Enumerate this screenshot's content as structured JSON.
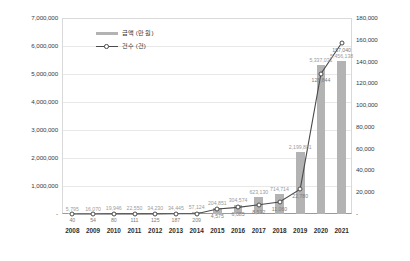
{
  "chart_data": {
    "type": "bar",
    "title": "",
    "subtitle": "",
    "xlabel": "",
    "ylabel": "",
    "categories": [
      "2008",
      "2009",
      "2010",
      "2011",
      "2012",
      "2013",
      "2014",
      "2015",
      "2016",
      "2017",
      "2018",
      "2019",
      "2020",
      "2021"
    ],
    "grid": true,
    "legend_position": "top-left",
    "axes": {
      "left": {
        "label": "금액 (만 원)",
        "ylim": [
          0,
          7000000
        ],
        "ticks": [
          0,
          1000000,
          2000000,
          3000000,
          4000000,
          5000000,
          6000000,
          7000000
        ],
        "tick_labels": [
          "-",
          "1,000,000",
          "2,000,000",
          "3,000,000",
          "4,000,000",
          "5,000,000",
          "6,000,000",
          "7,000,000"
        ]
      },
      "right": {
        "label": "건수 (건)",
        "ylim": [
          0,
          180000
        ],
        "ticks": [
          0,
          20000,
          40000,
          60000,
          80000,
          100000,
          120000,
          140000,
          160000,
          180000
        ],
        "tick_labels": [
          "-",
          "20,000",
          "40,000",
          "60,000",
          "80,000",
          "100,000",
          "120,000",
          "140,000",
          "160,000",
          "180,000"
        ]
      }
    },
    "series": [
      {
        "name": "금액 (만 원)",
        "type": "bar",
        "axis": "left",
        "color": "#b3b3b3",
        "values": [
          5795,
          16070,
          19946,
          22550,
          34230,
          34445,
          57124,
          204851,
          304574,
          623130,
          714714,
          2199881,
          5337031,
          5456138
        ],
        "value_labels": [
          "5,795",
          "16,070",
          "19,946",
          "22,550",
          "34,230",
          "34,445",
          "57,124",
          "204,851",
          "304,574",
          "623,130",
          "714,714",
          "2,199,881",
          "5,337,031",
          "5,456,138"
        ]
      },
      {
        "name": "건수 (건)",
        "type": "line",
        "axis": "right",
        "color": "#4a4a4a",
        "values": [
          40,
          54,
          80,
          111,
          125,
          187,
          209,
          4575,
          6085,
          8532,
          11060,
          22780,
          128844,
          157040
        ],
        "value_labels": [
          "40",
          "54",
          "80",
          "111",
          "125",
          "187",
          "209",
          "4,575",
          "6,085",
          "8,532",
          "11,060",
          "22,780",
          "128,844",
          "157,040"
        ]
      }
    ]
  },
  "legend": {
    "items": [
      {
        "label": "금액 (만 원)",
        "marker": "bar-swatch"
      },
      {
        "label": "건수 (건)",
        "marker": "line-marker"
      }
    ]
  }
}
